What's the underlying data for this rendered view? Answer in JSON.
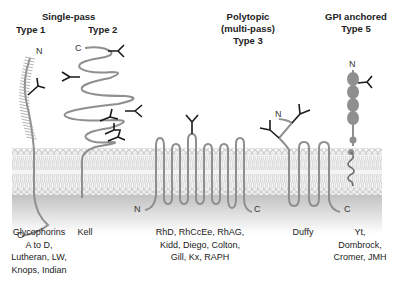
{
  "diagram": {
    "headers": {
      "single_pass": "Single-pass",
      "type1": "Type 1",
      "type2": "Type 2",
      "polytopic_line1": "Polytopic",
      "polytopic_line2": "(multi-pass)",
      "type3": "Type 3",
      "gpi_line1": "GPI anchored",
      "type5": "Type 5"
    },
    "terminals": {
      "type1_n": "N",
      "type1_c": "C",
      "type2_c": "C",
      "type3_n": "N",
      "type3_c": "C",
      "duffy_n": "N",
      "duffy_c": "C",
      "gpi_n": "N"
    },
    "captions": {
      "type1": [
        "Glycophorins",
        "A to D,",
        "Lutheran, LW,",
        "Knops, Indian"
      ],
      "type2": [
        "Kell"
      ],
      "type3": [
        "RhD, RhCcEe, RhAG,",
        "Kidd, Diego, Colton,",
        "Gill, Kx, RAPH"
      ],
      "duffy": [
        "Duffy"
      ],
      "type5": [
        "Yt,",
        "Dombrock,",
        "Cromer, JMH"
      ]
    },
    "colors": {
      "protein": "#8f8f8f",
      "glycan": "#1a1a1a",
      "membrane_head": "#e6e6e6",
      "cytoplasm": "#c8c8c8"
    }
  }
}
